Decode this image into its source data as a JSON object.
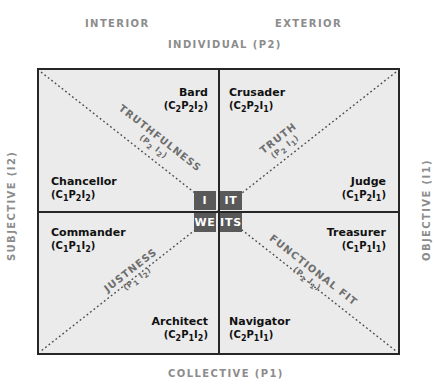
{
  "axes": {
    "interior": "INTERIOR",
    "exterior": "EXTERIOR",
    "individual": "INDIVIDUAL (P2)",
    "collective": "COLLECTIVE (P1)",
    "subjective": "SUBJECTIVE (I2)",
    "objective": "OBJECTIVE (I1)"
  },
  "quadrants": [
    {
      "key": "bard",
      "name": "Bard",
      "code_html": "(C<sub>2</sub>P<sub>2</sub>I<sub>2</sub>)",
      "code_text": "(C2P2I2)"
    },
    {
      "key": "crusader",
      "name": "Crusader",
      "code_html": "(C<sub>2</sub>P<sub>2</sub>I<sub>1</sub>)",
      "code_text": "(C2P2I1)"
    },
    {
      "key": "chancellor",
      "name": "Chancellor",
      "code_html": "(C<sub>1</sub>P<sub>2</sub>I<sub>2</sub>)",
      "code_text": "(C1P2I2)"
    },
    {
      "key": "judge",
      "name": "Judge",
      "code_html": "(C<sub>1</sub>P<sub>2</sub>I<sub>1</sub>)",
      "code_text": "(C1P2I1)"
    },
    {
      "key": "commander",
      "name": "Commander",
      "code_html": "(C<sub>1</sub>P<sub>1</sub>I<sub>2</sub>)",
      "code_text": "(C1P1I2)"
    },
    {
      "key": "treasurer",
      "name": "Treasurer",
      "code_html": "(C<sub>1</sub>P<sub>1</sub>I<sub>1</sub>)",
      "code_text": "(C1P1I1)"
    },
    {
      "key": "architect",
      "name": "Architect",
      "code_html": "(C<sub>2</sub>P<sub>1</sub>I<sub>2</sub>)",
      "code_text": "(C2P1I2)"
    },
    {
      "key": "navigator",
      "name": "Navigator",
      "code_html": "(C<sub>2</sub>P<sub>1</sub>I<sub>1</sub>)",
      "code_text": "(C2P1I1)"
    }
  ],
  "diagonals": [
    {
      "key": "truthfulness",
      "label": "TRUTHFULNESS",
      "sub_html": "(P<sub>2</sub> I<sub>2</sub>)",
      "sub_text": "(P2 I2)"
    },
    {
      "key": "truth",
      "label": "TRUTH",
      "sub_html": "(P<sub>2</sub> I<sub>1</sub>)",
      "sub_text": "(P2 I1)"
    },
    {
      "key": "justness",
      "label": "JUSTNESS",
      "sub_html": "(P<sub>1</sub> I<sub>2</sub>)",
      "sub_text": "(P1 I2)"
    },
    {
      "key": "functional_fit",
      "label": "FUNCTIONAL FIT",
      "sub_html": "(P<sub>1</sub> I<sub>1</sub>)",
      "sub_text": "(P1 I1)"
    }
  ],
  "center_cells": [
    {
      "key": "i",
      "label": "I"
    },
    {
      "key": "it",
      "label": "IT"
    },
    {
      "key": "we",
      "label": "WE"
    },
    {
      "key": "its",
      "label": "ITS"
    }
  ],
  "colors": {
    "frame_fill": "#ebebeb",
    "frame_line": "#262626",
    "center_cell": "#595959",
    "center_text": "#ffffff",
    "axis_caption": "#8c8c8c",
    "diagonal_label": "#6e6e6e",
    "role_text": "#111111",
    "page_background": "#ffffff"
  }
}
